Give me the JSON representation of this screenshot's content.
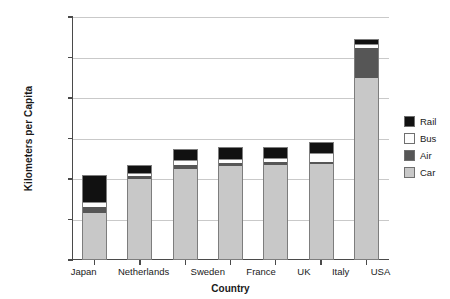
{
  "chart_data": {
    "type": "bar",
    "subtype": "stacked-bar",
    "title": "",
    "xlabel": "Country",
    "ylabel": "Kilometers per Capita",
    "categories": [
      "Japan",
      "Netherlands",
      "Sweden",
      "France",
      "UK",
      "Italy",
      "USA"
    ],
    "ylim": [
      0,
      30000
    ],
    "ytick_values": [
      0,
      5000,
      10000,
      15000,
      20000,
      25000,
      30000
    ],
    "ytick_labels": [
      "0",
      "5,000",
      "10,000",
      "15,000",
      "20,000",
      "25,000",
      "30,000"
    ],
    "grid": true,
    "grid_axis": "y",
    "legend_position": "right",
    "stack_order_bottom_to_top": [
      "Car",
      "Air",
      "Bus",
      "Rail"
    ],
    "series": [
      {
        "name": "Car",
        "color": "#c8c8c8",
        "values": [
          5700,
          9900,
          11100,
          11500,
          11600,
          11700,
          22300
        ]
      },
      {
        "name": "Air",
        "color": "#565656",
        "values": [
          700,
          300,
          450,
          400,
          350,
          300,
          3700
        ]
      },
      {
        "name": "Bus",
        "color": "#fdfdfd",
        "values": [
          600,
          400,
          700,
          400,
          500,
          1100,
          600
        ]
      },
      {
        "name": "Rail",
        "color": "#111111",
        "values": [
          3300,
          900,
          1150,
          1450,
          1200,
          1250,
          400
        ]
      }
    ],
    "totals": [
      10300,
      11500,
      13400,
      13750,
      13650,
      14350,
      27000
    ]
  },
  "legend": {
    "items": [
      {
        "label": "Rail",
        "color": "#111111"
      },
      {
        "label": "Bus",
        "color": "#fdfdfd"
      },
      {
        "label": "Air",
        "color": "#565656"
      },
      {
        "label": "Car",
        "color": "#c8c8c8"
      }
    ]
  }
}
